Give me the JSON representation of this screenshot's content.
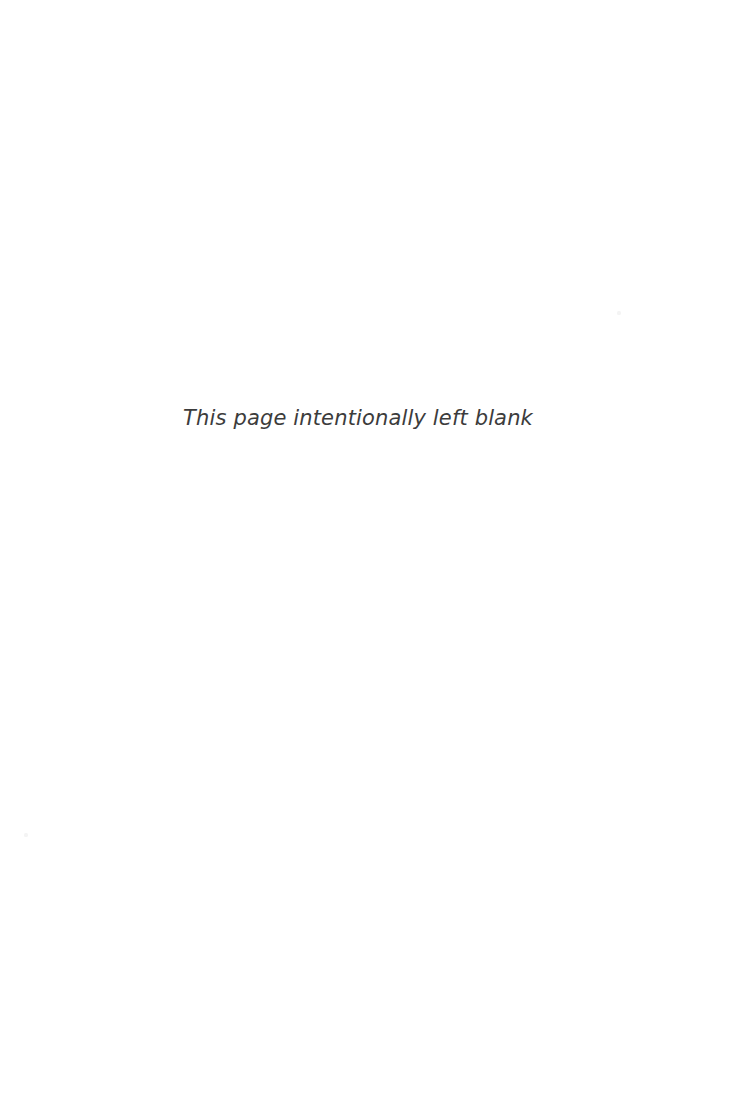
{
  "page": {
    "kind": "scanned-book-page",
    "background_color": "#ffffff",
    "width_px": 743,
    "height_px": 1118
  },
  "notice": {
    "text": "This page intentionally left blank",
    "text_color": "#3c3c3c",
    "style": "italic",
    "font_size_px": 21
  },
  "artifacts": {
    "speck_color": "#f4f4f4",
    "items": [
      {
        "name": "upper-right-speck",
        "x_px": 619,
        "y_px": 313
      },
      {
        "name": "lower-left-speck",
        "x_px": 26,
        "y_px": 835
      }
    ]
  }
}
